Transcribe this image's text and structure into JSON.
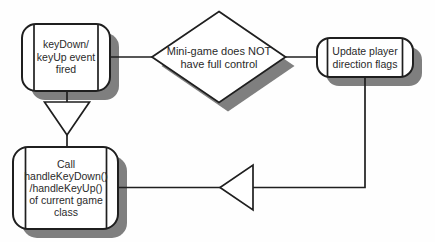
{
  "diagram": {
    "type": "flowchart",
    "topic": "keyboard event dispatch to mini-game",
    "colors": {
      "background": "#fefefe",
      "stroke": "#1f1f1f",
      "text": "#2a2a2a",
      "node_fill": "#ffffff",
      "shadow": "#7f7f7f"
    },
    "nodes": {
      "event_fired": {
        "shape": "rounded-process",
        "lines": [
          "keyDown/",
          "keyUp event",
          "fired"
        ]
      },
      "decision": {
        "shape": "decision-diamond",
        "lines": [
          "Mini-game does NOT",
          "have full control"
        ]
      },
      "update_flags": {
        "shape": "rounded-process",
        "lines": [
          "Update player",
          "direction flags"
        ]
      },
      "call_handler": {
        "shape": "rounded-process",
        "lines": [
          "Call",
          "handleKeyDown()",
          "/handleKeyUp()",
          "of current game",
          "class"
        ]
      }
    },
    "edges": [
      {
        "from": "event_fired",
        "to": "decision",
        "style": "plain-line"
      },
      {
        "from": "decision",
        "to": "update_flags",
        "style": "plain-line"
      },
      {
        "from": "event_fired",
        "to": "call_handler",
        "style": "open-triangle-arrow-down"
      },
      {
        "from": "update_flags",
        "to": "call_handler",
        "style": "open-triangle-arrow-left"
      }
    ]
  }
}
